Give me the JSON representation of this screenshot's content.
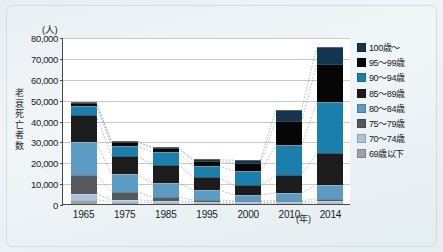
{
  "chart_data": {
    "type": "bar",
    "stacked": true,
    "title": "",
    "xlabel": "年",
    "ylabel": "老衰死亡者数",
    "unit_label": "(人)",
    "ylim": [
      0,
      80000
    ],
    "ytick_values": [
      0,
      10000,
      20000,
      30000,
      40000,
      50000,
      60000,
      70000,
      80000
    ],
    "ytick_labels": [
      "0",
      "10,000",
      "20,000",
      "30,000",
      "40,000",
      "50,000",
      "60,000",
      "70,000",
      "80,000"
    ],
    "grid": true,
    "legend_position": "right",
    "categories": [
      "1965",
      "1975",
      "1985",
      "1995",
      "2000",
      "2010",
      "2014"
    ],
    "series": [
      {
        "name": "69歳以下",
        "color": "#9ea2a4",
        "values": [
          2100,
          900,
          600,
          400,
          300,
          400,
          500
        ]
      },
      {
        "name": "70～74歳",
        "color": "#a9c4dd",
        "values": [
          2900,
          1100,
          900,
          600,
          500,
          500,
          900
        ]
      },
      {
        "name": "75～79歳",
        "color": "#56595b",
        "values": [
          9000,
          3900,
          1700,
          1000,
          700,
          700,
          1100
        ]
      },
      {
        "name": "80～84歳",
        "color": "#5b9bc4",
        "values": [
          15600,
          8400,
          6800,
          4700,
          2800,
          3800,
          6500
        ]
      },
      {
        "name": "85～89歳",
        "color": "#1c1c1c",
        "values": [
          12900,
          8800,
          8900,
          6000,
          4500,
          8400,
          15500
        ]
      },
      {
        "name": "90～94歳",
        "color": "#1b7fae",
        "values": [
          4700,
          4900,
          6000,
          5400,
          6900,
          14300,
          24400
        ]
      },
      {
        "name": "95～99歳",
        "color": "#060606",
        "values": [
          1400,
          1700,
          1900,
          2400,
          4000,
          11600,
          18000
        ]
      },
      {
        "name": "100歳～",
        "color": "#14354e",
        "values": [
          400,
          400,
          500,
          800,
          1400,
          5400,
          8400
        ]
      }
    ],
    "totals": [
      49000,
      30100,
      27300,
      21300,
      21100,
      45100,
      75300
    ]
  },
  "legend": {
    "entries": [
      {
        "label": "100歳～",
        "color": "#14354e"
      },
      {
        "label": "95～99歳",
        "color": "#060606"
      },
      {
        "label": "90～94歳",
        "color": "#1b7fae"
      },
      {
        "label": "85～89歳",
        "color": "#1c1c1c"
      },
      {
        "label": "80～84歳",
        "color": "#5b9bc4"
      },
      {
        "label": "75～79歳",
        "color": "#56595b"
      },
      {
        "label": "70～74歳",
        "color": "#a9c4dd"
      },
      {
        "label": "69歳以下",
        "color": "#9ea2a4"
      }
    ]
  },
  "axis": {
    "unit_label": "(人)",
    "y_title": "老衰死亡者数",
    "x_unit": "(年)"
  }
}
